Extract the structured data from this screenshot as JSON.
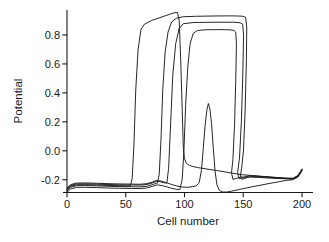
{
  "figure": {
    "background": "#ffffff",
    "width": 329,
    "height": 242
  },
  "chart_data": {
    "type": "line",
    "title": "",
    "xlabel": "Cell number",
    "ylabel": "Potential",
    "xlim": [
      0,
      200
    ],
    "ylim": [
      -0.3,
      0.97
    ],
    "x_ticks": [
      0,
      50,
      100,
      150,
      200
    ],
    "x_tick_labels": [
      "0",
      "50",
      "100",
      "150",
      "200"
    ],
    "y_ticks": [
      -0.2,
      0.0,
      0.2,
      0.4,
      0.6,
      0.8
    ],
    "y_tick_labels": [
      "-0.2",
      "0.0",
      "0.2",
      "0.4",
      "0.6",
      "0.8"
    ],
    "grid": false,
    "legend": false,
    "line_color": "#1a1a1a",
    "axis_color": "#1a1a1a",
    "series": [
      {
        "name": "pulse-1-wide-plateau",
        "points": [
          [
            0,
            -0.27
          ],
          [
            3,
            -0.246
          ],
          [
            8,
            -0.235
          ],
          [
            15,
            -0.234
          ],
          [
            25,
            -0.236
          ],
          [
            35,
            -0.239
          ],
          [
            45,
            -0.241
          ],
          [
            52,
            -0.242
          ],
          [
            54,
            -0.242
          ],
          [
            55.5,
            -0.19
          ],
          [
            57,
            0.05
          ],
          [
            58.5,
            0.42
          ],
          [
            60.5,
            0.7
          ],
          [
            63,
            0.84
          ],
          [
            66,
            0.875
          ],
          [
            72,
            0.9
          ],
          [
            80,
            0.922
          ],
          [
            87,
            0.942
          ],
          [
            91,
            0.953
          ],
          [
            94,
            0.955
          ],
          [
            95.5,
            0.9
          ],
          [
            96.8,
            0.62
          ],
          [
            98,
            0.3
          ],
          [
            99,
            0.02
          ],
          [
            100,
            -0.055
          ],
          [
            101.5,
            -0.085
          ],
          [
            104,
            -0.1
          ],
          [
            107,
            -0.108
          ],
          [
            112,
            -0.117
          ],
          [
            120,
            -0.127
          ],
          [
            128,
            -0.137
          ],
          [
            136,
            -0.148
          ],
          [
            144,
            -0.159
          ],
          [
            150,
            -0.166
          ],
          [
            158,
            -0.171
          ],
          [
            168,
            -0.178
          ],
          [
            178,
            -0.184
          ],
          [
            188,
            -0.19
          ],
          [
            193,
            -0.189
          ],
          [
            196.5,
            -0.17
          ],
          [
            199,
            -0.14
          ],
          [
            200,
            -0.128
          ]
        ]
      },
      {
        "name": "pulse-2-top-plateau",
        "points": [
          [
            0,
            -0.276
          ],
          [
            3,
            -0.252
          ],
          [
            8,
            -0.241
          ],
          [
            15,
            -0.24
          ],
          [
            25,
            -0.242
          ],
          [
            35,
            -0.245
          ],
          [
            45,
            -0.247
          ],
          [
            55,
            -0.248
          ],
          [
            62,
            -0.249
          ],
          [
            68,
            -0.245
          ],
          [
            73,
            -0.233
          ],
          [
            77,
            -0.222
          ],
          [
            78.5,
            -0.16
          ],
          [
            80,
            0.08
          ],
          [
            81.5,
            0.42
          ],
          [
            83.5,
            0.68
          ],
          [
            86,
            0.82
          ],
          [
            89,
            0.89
          ],
          [
            93,
            0.915
          ],
          [
            99,
            0.926
          ],
          [
            110,
            0.929
          ],
          [
            125,
            0.931
          ],
          [
            140,
            0.932
          ],
          [
            149,
            0.93
          ],
          [
            152,
            0.922
          ],
          [
            153,
            0.85
          ],
          [
            152.6,
            0.6
          ],
          [
            151.6,
            0.28
          ],
          [
            150.2,
            0.0
          ],
          [
            148.6,
            -0.12
          ],
          [
            147.6,
            -0.175
          ],
          [
            148.8,
            -0.197
          ],
          [
            151.5,
            -0.19
          ],
          [
            156,
            -0.178
          ],
          [
            165,
            -0.18
          ],
          [
            175,
            -0.186
          ],
          [
            185,
            -0.191
          ],
          [
            192,
            -0.194
          ],
          [
            196.5,
            -0.176
          ],
          [
            199,
            -0.146
          ],
          [
            200,
            -0.132
          ]
        ]
      },
      {
        "name": "pulse-3-mid-plateau",
        "points": [
          [
            0,
            -0.264
          ],
          [
            3,
            -0.24
          ],
          [
            8,
            -0.229
          ],
          [
            15,
            -0.228
          ],
          [
            25,
            -0.23
          ],
          [
            35,
            -0.233
          ],
          [
            45,
            -0.235
          ],
          [
            55,
            -0.236
          ],
          [
            62,
            -0.237
          ],
          [
            68,
            -0.233
          ],
          [
            73,
            -0.221
          ],
          [
            76,
            -0.211
          ],
          [
            79,
            -0.213
          ],
          [
            83,
            -0.222
          ],
          [
            85,
            -0.222
          ],
          [
            86.5,
            -0.12
          ],
          [
            88,
            0.15
          ],
          [
            90,
            0.52
          ],
          [
            92.5,
            0.74
          ],
          [
            95.5,
            0.845
          ],
          [
            99,
            0.878
          ],
          [
            108,
            0.886
          ],
          [
            125,
            0.888
          ],
          [
            142,
            0.888
          ],
          [
            147.5,
            0.884
          ],
          [
            149.5,
            0.875
          ],
          [
            150.3,
            0.8
          ],
          [
            149.6,
            0.52
          ],
          [
            148.4,
            0.2
          ],
          [
            146.8,
            -0.05
          ],
          [
            145.2,
            -0.15
          ],
          [
            146.5,
            -0.192
          ],
          [
            150,
            -0.185
          ],
          [
            155,
            -0.172
          ],
          [
            165,
            -0.177
          ],
          [
            175,
            -0.183
          ],
          [
            185,
            -0.189
          ],
          [
            192,
            -0.191
          ],
          [
            196.5,
            -0.172
          ],
          [
            199,
            -0.142
          ],
          [
            200,
            -0.126
          ]
        ]
      },
      {
        "name": "pulse-4-low-plateau",
        "points": [
          [
            0,
            -0.288
          ],
          [
            3,
            -0.264
          ],
          [
            8,
            -0.253
          ],
          [
            15,
            -0.252
          ],
          [
            25,
            -0.254
          ],
          [
            35,
            -0.257
          ],
          [
            45,
            -0.259
          ],
          [
            55,
            -0.26
          ],
          [
            62,
            -0.261
          ],
          [
            68,
            -0.257
          ],
          [
            73,
            -0.245
          ],
          [
            77,
            -0.235
          ],
          [
            82,
            -0.242
          ],
          [
            88,
            -0.256
          ],
          [
            93,
            -0.266
          ],
          [
            96,
            -0.269
          ],
          [
            98,
            -0.2
          ],
          [
            99.5,
            0.0
          ],
          [
            101,
            0.32
          ],
          [
            102.8,
            0.58
          ],
          [
            104.8,
            0.74
          ],
          [
            107.5,
            0.812
          ],
          [
            111,
            0.831
          ],
          [
            118,
            0.836
          ],
          [
            128,
            0.837
          ],
          [
            138,
            0.836
          ],
          [
            142,
            0.832
          ],
          [
            143.6,
            0.82
          ],
          [
            144.2,
            0.74
          ],
          [
            143.6,
            0.48
          ],
          [
            142.6,
            0.18
          ],
          [
            141.2,
            -0.06
          ],
          [
            140,
            -0.152
          ],
          [
            141.2,
            -0.197
          ],
          [
            144,
            -0.191
          ],
          [
            148,
            -0.181
          ],
          [
            156,
            -0.181
          ],
          [
            166,
            -0.185
          ],
          [
            176,
            -0.19
          ],
          [
            186,
            -0.193
          ],
          [
            192,
            -0.195
          ],
          [
            196.5,
            -0.178
          ],
          [
            199,
            -0.148
          ],
          [
            200,
            -0.134
          ]
        ]
      },
      {
        "name": "pulse-5-small-spike",
        "points": [
          [
            0,
            -0.258
          ],
          [
            3,
            -0.234
          ],
          [
            8,
            -0.223
          ],
          [
            15,
            -0.222
          ],
          [
            25,
            -0.224
          ],
          [
            35,
            -0.227
          ],
          [
            45,
            -0.229
          ],
          [
            55,
            -0.23
          ],
          [
            62,
            -0.231
          ],
          [
            68,
            -0.227
          ],
          [
            73,
            -0.215
          ],
          [
            76,
            -0.205
          ],
          [
            79,
            -0.207
          ],
          [
            83,
            -0.216
          ],
          [
            88,
            -0.23
          ],
          [
            93,
            -0.242
          ],
          [
            98,
            -0.25
          ],
          [
            103,
            -0.252
          ],
          [
            107,
            -0.248
          ],
          [
            110,
            -0.242
          ],
          [
            112.5,
            -0.22
          ],
          [
            114.5,
            -0.13
          ],
          [
            116,
            0.02
          ],
          [
            117.5,
            0.17
          ],
          [
            119,
            0.28
          ],
          [
            120.3,
            0.327
          ],
          [
            121.6,
            0.29
          ],
          [
            123,
            0.19
          ],
          [
            124.5,
            0.02
          ],
          [
            126,
            -0.14
          ],
          [
            127.6,
            -0.235
          ],
          [
            129.6,
            -0.272
          ],
          [
            132,
            -0.284
          ],
          [
            136,
            -0.285
          ],
          [
            140,
            -0.279
          ],
          [
            146,
            -0.268
          ],
          [
            152,
            -0.258
          ],
          [
            158,
            -0.248
          ],
          [
            165,
            -0.237
          ],
          [
            172,
            -0.226
          ],
          [
            180,
            -0.214
          ],
          [
            187,
            -0.204
          ],
          [
            192,
            -0.2
          ],
          [
            196.5,
            -0.182
          ],
          [
            199,
            -0.152
          ],
          [
            200,
            -0.138
          ]
        ]
      }
    ]
  }
}
